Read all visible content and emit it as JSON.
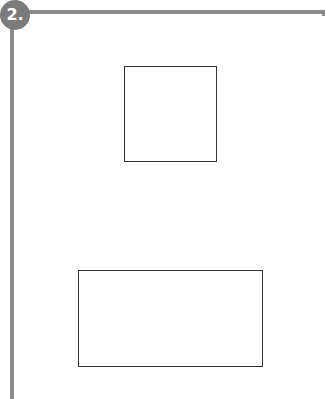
{
  "exercise": {
    "number_label": "2.",
    "shapes": [
      {
        "name": "square",
        "type": "square"
      },
      {
        "name": "rectangle",
        "type": "rectangle"
      }
    ],
    "colors": {
      "frame": "#8a8a8a",
      "badge": "#7b7b7b",
      "outline": "#333333"
    }
  }
}
